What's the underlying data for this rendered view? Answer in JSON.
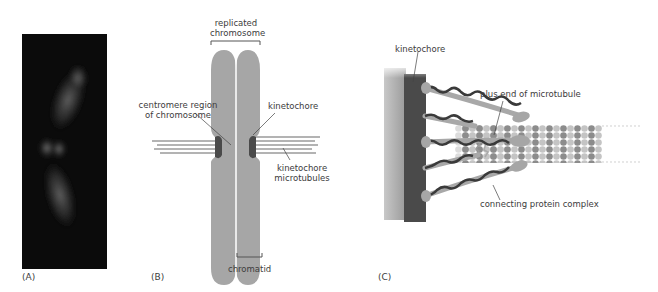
{
  "figure": {
    "panels": [
      {
        "id": "A",
        "label": "(A)",
        "type": "micrograph",
        "description": "fluorescence image of replicated chromosome"
      },
      {
        "id": "B",
        "label": "(B)",
        "type": "schematic"
      },
      {
        "id": "C",
        "label": "(C)",
        "type": "schematic"
      }
    ]
  },
  "panel_b": {
    "labels": {
      "replicated_chromosome": "replicated chromosome",
      "replicated_line1": "replicated",
      "replicated_line2": "chromosome",
      "centromere_line1": "centromere region",
      "centromere_line2": "of chromosome",
      "kinetochore": "kinetochore",
      "kt_micro_line1": "kinetochore",
      "kt_micro_line2": "microtubules",
      "chromatid": "chromatid"
    }
  },
  "panel_c": {
    "labels": {
      "kinetochore": "kinetochore",
      "plus_end": "plus end of microtubule",
      "connecting_complex": "connecting protein complex"
    }
  },
  "colors": {
    "chromosome_gray": "#a6a6a6",
    "kinetochore_dark": "#4a4a4a",
    "microtubule_line": "#9a9a9a",
    "tubulin_dark": "#8c8c8c",
    "tubulin_light": "#c4c4c4",
    "micrograph_bg": "#0b0b0b"
  }
}
